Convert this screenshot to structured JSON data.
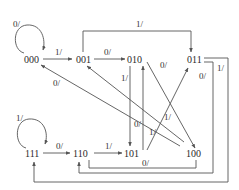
{
  "diagram": {
    "type": "state-transition",
    "colors": {
      "line": "#555555",
      "text": "#2a2a2a",
      "background": "#ffffff"
    },
    "states": {
      "s000": "000",
      "s001": "001",
      "s010": "010",
      "s011": "011",
      "s100": "100",
      "s101": "101",
      "s110": "110",
      "s111": "111"
    },
    "transitions": [
      {
        "from": "000",
        "to": "000",
        "label": "0/"
      },
      {
        "from": "000",
        "to": "001",
        "label": "1/"
      },
      {
        "from": "001",
        "to": "010",
        "label": "0/"
      },
      {
        "from": "001",
        "to": "011",
        "label": "1/"
      },
      {
        "from": "010",
        "to": "101",
        "label": "1/"
      },
      {
        "from": "010",
        "to": "100",
        "label": "0/"
      },
      {
        "from": "101",
        "to": "010",
        "label": "0/"
      },
      {
        "from": "101",
        "to": "011",
        "label": "1/"
      },
      {
        "from": "100",
        "to": "000",
        "label": "0/"
      },
      {
        "from": "100",
        "to": "001",
        "label": "1/"
      },
      {
        "from": "011",
        "to": "110",
        "label": "0/"
      },
      {
        "from": "011",
        "to": "111",
        "label": "1/"
      },
      {
        "from": "111",
        "to": "111",
        "label": "1/"
      },
      {
        "from": "111",
        "to": "110",
        "label": "0/"
      },
      {
        "from": "110",
        "to": "101",
        "label": "1/"
      },
      {
        "from": "110",
        "to": "100",
        "label": "0/"
      }
    ],
    "labels": {
      "l000_loop": "0/",
      "l000_001": "1/",
      "l001_010": "0/",
      "l001_011": "1/",
      "l010_101": "1/",
      "l010_100": "0/",
      "l101_010": "0/",
      "l101_011": "1/",
      "l100_000": "0/",
      "l100_001": "1/",
      "l011_110": "0/",
      "l011_111": "1/",
      "l111_loop": "1/",
      "l111_110": "0/",
      "l110_101": "1/",
      "l110_100": "0/"
    }
  }
}
